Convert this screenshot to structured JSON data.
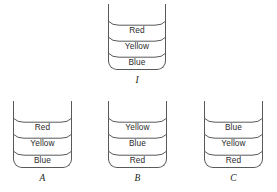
{
  "diagram": {
    "colors": {
      "outline": "#58595b",
      "text": "#2b2b2b",
      "label": "#231f20",
      "background": "#ffffff"
    },
    "vessels": [
      {
        "id": "top",
        "label": "I",
        "layers": [
          {
            "name": "Red"
          },
          {
            "name": "Yellow"
          },
          {
            "name": "Blue"
          }
        ]
      },
      {
        "id": "a",
        "label": "A",
        "layers": [
          {
            "name": "Red"
          },
          {
            "name": "Yellow"
          },
          {
            "name": "Blue"
          }
        ]
      },
      {
        "id": "b",
        "label": "B",
        "layers": [
          {
            "name": "Yellow"
          },
          {
            "name": "Blue"
          },
          {
            "name": "Red"
          }
        ]
      },
      {
        "id": "c",
        "label": "C",
        "layers": [
          {
            "name": "Blue"
          },
          {
            "name": "Yellow"
          },
          {
            "name": "Red"
          }
        ]
      }
    ]
  }
}
